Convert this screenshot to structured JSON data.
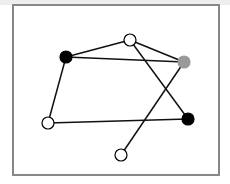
{
  "diagram": {
    "type": "graph",
    "frame": {
      "x": 13,
      "y": 5,
      "width": 206,
      "height": 170,
      "stroke": "#888888",
      "stroke_width": 2
    },
    "colors": {
      "black": "#000000",
      "white": "#ffffff",
      "gray": "#999999",
      "edge": "#111111"
    },
    "nodes": [
      {
        "id": "n1",
        "x": 66,
        "y": 57,
        "fill": "black"
      },
      {
        "id": "n2",
        "x": 130,
        "y": 40,
        "fill": "white"
      },
      {
        "id": "n3",
        "x": 184,
        "y": 62,
        "fill": "gray"
      },
      {
        "id": "n4",
        "x": 188,
        "y": 119,
        "fill": "black"
      },
      {
        "id": "n5",
        "x": 48,
        "y": 123,
        "fill": "white"
      },
      {
        "id": "n6",
        "x": 121,
        "y": 155,
        "fill": "white"
      }
    ],
    "edges": [
      [
        "n1",
        "n2"
      ],
      [
        "n1",
        "n3"
      ],
      [
        "n1",
        "n5"
      ],
      [
        "n2",
        "n3"
      ],
      [
        "n2",
        "n4"
      ],
      [
        "n3",
        "n6"
      ],
      [
        "n5",
        "n4"
      ]
    ],
    "node_radius": 6
  }
}
